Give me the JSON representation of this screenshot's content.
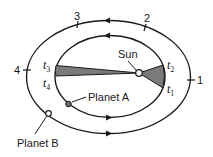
{
  "diagram": {
    "colors": {
      "line": "#1a1a1a",
      "wedge_fill": "#7a7a7a",
      "planet_a_fill": "#6b6b6b",
      "background": "#ffffff"
    },
    "sun": {
      "label": "Sun"
    },
    "planet_a": {
      "label": "Planet A"
    },
    "planet_b": {
      "label": "Planet B"
    },
    "outer_orbit_marks": [
      {
        "label": "1"
      },
      {
        "label": "2"
      },
      {
        "label": "3"
      },
      {
        "label": "4"
      }
    ],
    "time_labels": [
      {
        "t": "t",
        "sub": "1"
      },
      {
        "t": "t",
        "sub": "2"
      },
      {
        "t": "t",
        "sub": "3"
      },
      {
        "t": "t",
        "sub": "4"
      }
    ]
  }
}
